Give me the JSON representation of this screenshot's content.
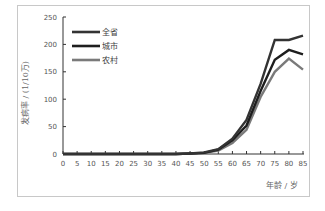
{
  "chart_data": {
    "type": "line",
    "title": "",
    "xlabel": "年龄 / 岁",
    "ylabel": "发病率 / (1/10万)",
    "x": [
      0,
      5,
      10,
      15,
      20,
      25,
      30,
      35,
      40,
      45,
      50,
      55,
      60,
      65,
      70,
      75,
      80,
      85
    ],
    "x_tick_labels": [
      "0",
      "5",
      "10",
      "15",
      "20",
      "25",
      "30",
      "35",
      "40",
      "45",
      "50",
      "55",
      "60",
      "65",
      "70",
      "75",
      "80",
      "85"
    ],
    "y_ticks": [
      0,
      50,
      100,
      150,
      200,
      250
    ],
    "xlim": [
      0,
      85
    ],
    "ylim": [
      0,
      250
    ],
    "grid": false,
    "legend_position": "upper-left",
    "series": [
      {
        "name": "全省",
        "color": "#333333",
        "values": [
          0,
          0,
          0,
          0,
          0,
          0,
          0,
          0,
          0,
          1,
          3,
          9,
          28,
          62,
          128,
          208,
          208,
          216
        ]
      },
      {
        "name": "城市",
        "color": "#1e1e1e",
        "values": [
          0,
          0,
          0,
          0,
          0,
          0,
          0,
          0,
          0,
          1,
          2,
          8,
          25,
          52,
          115,
          172,
          190,
          182
        ]
      },
      {
        "name": "农村",
        "color": "#7a7a7a",
        "values": [
          0,
          0,
          0,
          0,
          0,
          0,
          0,
          0,
          0,
          1,
          2,
          6,
          20,
          44,
          104,
          150,
          174,
          154
        ]
      }
    ]
  }
}
